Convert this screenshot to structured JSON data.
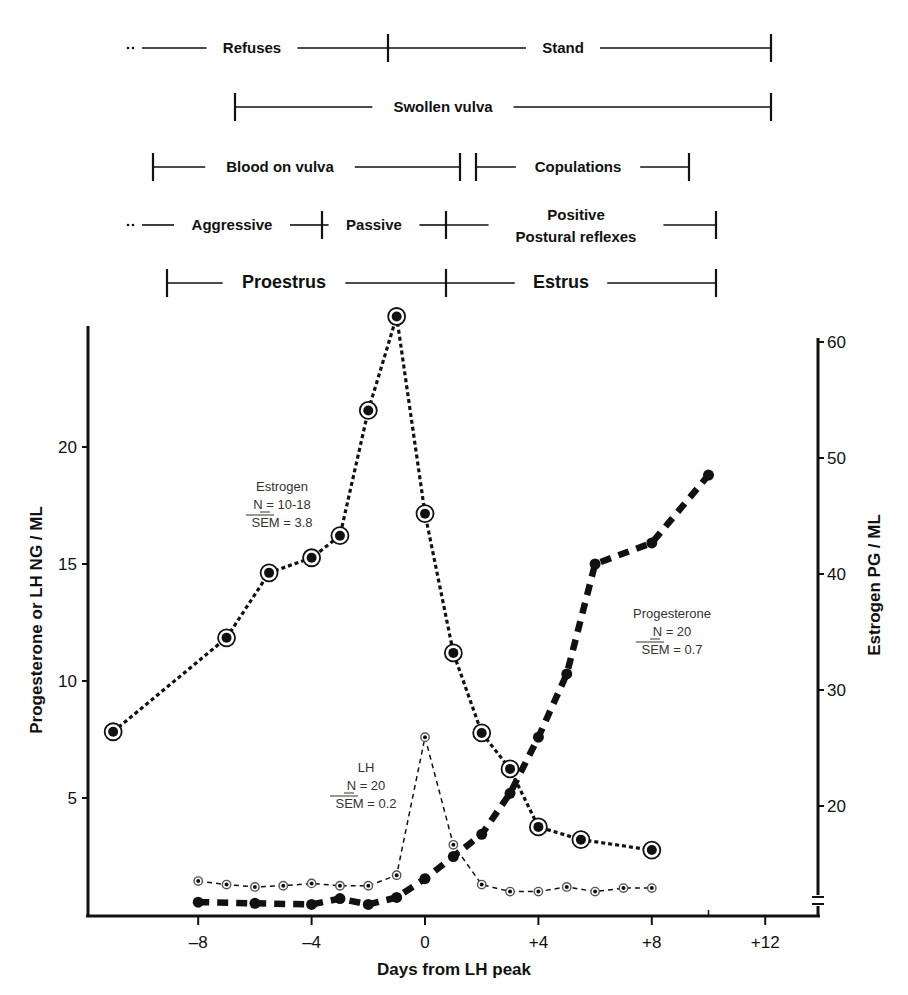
{
  "timeline": {
    "rows": [
      {
        "segments": [
          {
            "label": "Refuses",
            "x1": 128,
            "x2": 388,
            "left_cap": "dots",
            "right_cap": "bar",
            "label_x": 252
          },
          {
            "label": "Stand",
            "x1": 388,
            "x2": 771,
            "left_cap": "none",
            "right_cap": "bar",
            "label_x": 563
          }
        ],
        "y": 48,
        "bold_size": "normal"
      },
      {
        "segments": [
          {
            "label": "Swollen vulva",
            "x1": 235,
            "x2": 771,
            "left_cap": "bar",
            "right_cap": "bar",
            "label_x": 443
          }
        ],
        "y": 107,
        "bold_size": "normal"
      },
      {
        "segments": [
          {
            "label": "Blood on vulva",
            "x1": 153,
            "x2": 460,
            "left_cap": "bar",
            "right_cap": "bar",
            "label_x": 280
          },
          {
            "label": "Copulations",
            "x1": 476,
            "x2": 689,
            "left_cap": "bar",
            "right_cap": "bar",
            "label_x": 578
          }
        ],
        "y": 167,
        "bold_size": "normal"
      },
      {
        "segments": [
          {
            "label": "Aggressive",
            "x1": 128,
            "x2": 322,
            "left_cap": "dots",
            "right_cap": "bar",
            "label_x": 232
          },
          {
            "label": "Passive",
            "x1": 322,
            "x2": 446,
            "left_cap": "none",
            "right_cap": "bar",
            "label_x": 374
          },
          {
            "label": "Positive|Postural reflexes",
            "x1": 446,
            "x2": 716,
            "left_cap": "none",
            "right_cap": "bar",
            "label_x": 576
          }
        ],
        "y": 225,
        "bold_size": "normal"
      },
      {
        "segments": [
          {
            "label": "Proestrus",
            "x1": 167,
            "x2": 446,
            "left_cap": "bar",
            "right_cap": "bar",
            "label_x": 284
          },
          {
            "label": "Estrus",
            "x1": 446,
            "x2": 716,
            "left_cap": "none",
            "right_cap": "bar",
            "label_x": 561
          }
        ],
        "y": 283,
        "bold_size": "big"
      }
    ]
  },
  "chart_data": {
    "type": "line",
    "title": "",
    "xlabel": "Days from LH peak",
    "ylabel": "Progesterone or LH NG / ML",
    "ylabel_right": "Estrogen PG / ML",
    "x_ticks": [
      "-8",
      "-4",
      "0",
      "+4",
      "+8",
      "+12"
    ],
    "x_tick_values": [
      -8,
      -4,
      0,
      4,
      8,
      12
    ],
    "y_ticks_left": [
      5,
      10,
      15,
      20
    ],
    "y_ticks_right": [
      20,
      30,
      40,
      50,
      60
    ],
    "xlim": [
      -11.5,
      13.8
    ],
    "ylim_left": [
      0,
      25
    ],
    "ylim_right": [
      12,
      61
    ],
    "grid": false,
    "series": [
      {
        "name": "Estrogen",
        "axis": "right",
        "annotation": [
          "Estrogen",
          "N = 10-18",
          "SEM = 3.8"
        ],
        "annotation_pos": [
          282,
          491
        ],
        "marker": "large-ringed-dot",
        "line": "dotted-medium",
        "x": [
          -11,
          -7,
          -5.5,
          -4,
          -3,
          -2,
          -1,
          0,
          1,
          2,
          3,
          4,
          5.5,
          8
        ],
        "values": [
          26.4,
          34.5,
          40.1,
          41.4,
          43.3,
          54.1,
          62.2,
          45.2,
          33.2,
          26.3,
          23.2,
          18.2,
          17.1,
          16.2
        ]
      },
      {
        "name": "Progesterone",
        "axis": "left",
        "annotation": [
          "Progesterone",
          "N = 20",
          "SEM = 0.7"
        ],
        "annotation_pos": [
          672,
          618
        ],
        "marker": "solid-dot",
        "line": "heavy-dashed",
        "x": [
          -8,
          -6,
          -4,
          -3,
          -2,
          -1,
          0,
          1,
          2,
          3,
          4,
          5,
          6,
          8,
          10
        ],
        "values": [
          0.55,
          0.5,
          0.45,
          0.7,
          0.45,
          0.75,
          1.55,
          2.5,
          3.45,
          5.2,
          7.6,
          10.3,
          15.0,
          15.9,
          18.8
        ]
      },
      {
        "name": "LH",
        "axis": "left",
        "annotation": [
          "LH",
          "N = 20",
          "SEM = 0.2"
        ],
        "annotation_pos": [
          366,
          772
        ],
        "marker": "small-ringed-dot",
        "line": "thin-dashed",
        "x": [
          -8,
          -7,
          -6,
          -5,
          -4,
          -3,
          -2,
          -1,
          0,
          1,
          2,
          3,
          4,
          5,
          6,
          7,
          8
        ],
        "values": [
          1.45,
          1.3,
          1.2,
          1.25,
          1.35,
          1.25,
          1.25,
          1.7,
          7.6,
          3.0,
          1.3,
          1.0,
          1.0,
          1.2,
          1.0,
          1.15,
          1.15
        ]
      }
    ]
  }
}
